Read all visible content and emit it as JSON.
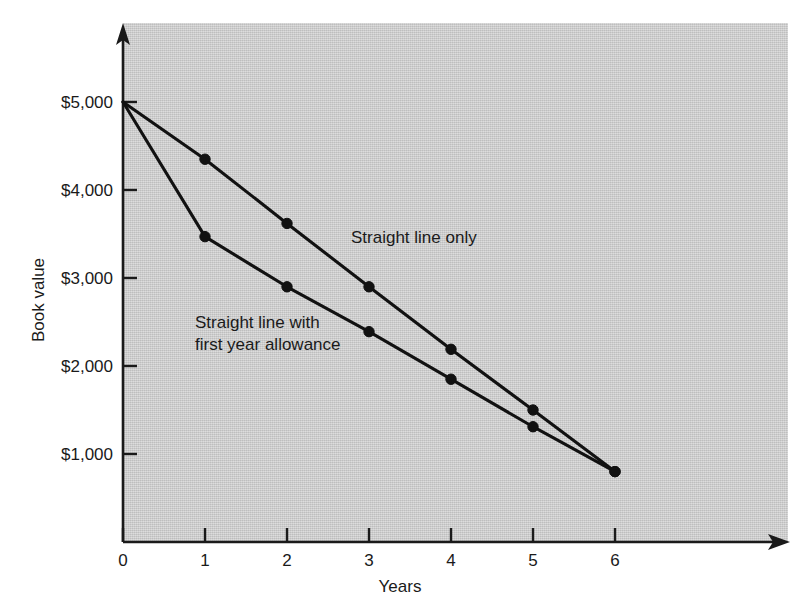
{
  "chart_data": {
    "type": "line",
    "title": "",
    "xlabel": "Years",
    "ylabel": "Book value",
    "x": [
      0,
      1,
      2,
      3,
      4,
      5,
      6
    ],
    "xtick_labels": [
      "0",
      "1",
      "2",
      "3",
      "4",
      "5",
      "6"
    ],
    "ytick_values": [
      1000,
      2000,
      3000,
      4000,
      5000
    ],
    "ytick_labels": [
      "$1,000",
      "$2,000",
      "$3,000",
      "$4,000",
      "$5,000"
    ],
    "xlim": [
      0,
      6
    ],
    "ylim": [
      0,
      5000
    ],
    "grid": false,
    "legend_position": "inline-annotations",
    "series": [
      {
        "name": "Straight line only",
        "values": [
          5000,
          4350,
          3620,
          2900,
          2190,
          1500,
          800
        ],
        "marker": "circle",
        "color": "#111111"
      },
      {
        "name": "Straight line with first year allowance",
        "values": [
          5000,
          3470,
          2900,
          2390,
          1850,
          1310,
          800
        ],
        "marker": "circle",
        "color": "#111111"
      }
    ],
    "annotations": [
      {
        "id": "annotation-straight-line-only",
        "lines": [
          "Straight line only"
        ],
        "x": 2.55,
        "y": 3500
      },
      {
        "id": "annotation-first-year-allowance",
        "lines": [
          "Straight line with",
          "first year allowance"
        ],
        "x": 0.95,
        "y": 2560
      }
    ],
    "plot_background_color": "#d0d0d0",
    "page_background_color": "#ffffff",
    "line_color": "#111111",
    "axis_color": "#1a1a1a"
  }
}
